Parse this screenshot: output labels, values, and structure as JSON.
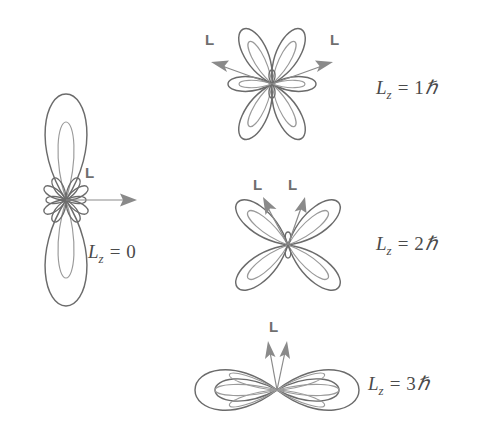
{
  "figure": {
    "background_color": "#ffffff",
    "curve_color": "#6b6b6b",
    "inner_curve_color": "#9a9a9a",
    "arrow_color": "#8a8a8a",
    "label_color": "#4a4a4a",
    "vector_label_color": "#6f6f6f",
    "caption": "Angular momentum vector orientations for l = 3 orbital probability distributions"
  },
  "panels": [
    {
      "id": "lz0",
      "name": "lz-0-panel",
      "lobe_count": 8,
      "orientation": "vertical",
      "lz_label": {
        "symbol": "L",
        "subscript": "z",
        "equals": "=",
        "value": "0",
        "hbar": ""
      },
      "vectors": [
        {
          "label": "L",
          "direction_deg": 0,
          "description": "horizontal right"
        }
      ]
    },
    {
      "id": "lz1",
      "name": "lz-1-panel",
      "lobe_count": 6,
      "orientation": "rosette",
      "lz_label": {
        "symbol": "L",
        "subscript": "z",
        "equals": "=",
        "value": "1",
        "hbar": "ℏ"
      },
      "vectors": [
        {
          "label": "L",
          "direction_deg": 160,
          "description": "up-left"
        },
        {
          "label": "L",
          "direction_deg": 20,
          "description": "up-right"
        }
      ]
    },
    {
      "id": "lz2",
      "name": "lz-2-panel",
      "lobe_count": 4,
      "orientation": "cross",
      "lz_label": {
        "symbol": "L",
        "subscript": "z",
        "equals": "=",
        "value": "2",
        "hbar": "ℏ"
      },
      "vectors": [
        {
          "label": "L",
          "direction_deg": 123,
          "description": "steep up-left"
        },
        {
          "label": "L",
          "direction_deg": 57,
          "description": "steep up-right"
        }
      ]
    },
    {
      "id": "lz3",
      "name": "lz-3-panel",
      "lobe_count": 2,
      "orientation": "horizontal",
      "lz_label": {
        "symbol": "L",
        "subscript": "z",
        "equals": "=",
        "value": "3",
        "hbar": "ℏ"
      },
      "vectors": [
        {
          "label": "L",
          "direction_deg": 99,
          "description": "near vertical left"
        },
        {
          "label": "L",
          "direction_deg": 81,
          "description": "near vertical right"
        }
      ]
    }
  ]
}
